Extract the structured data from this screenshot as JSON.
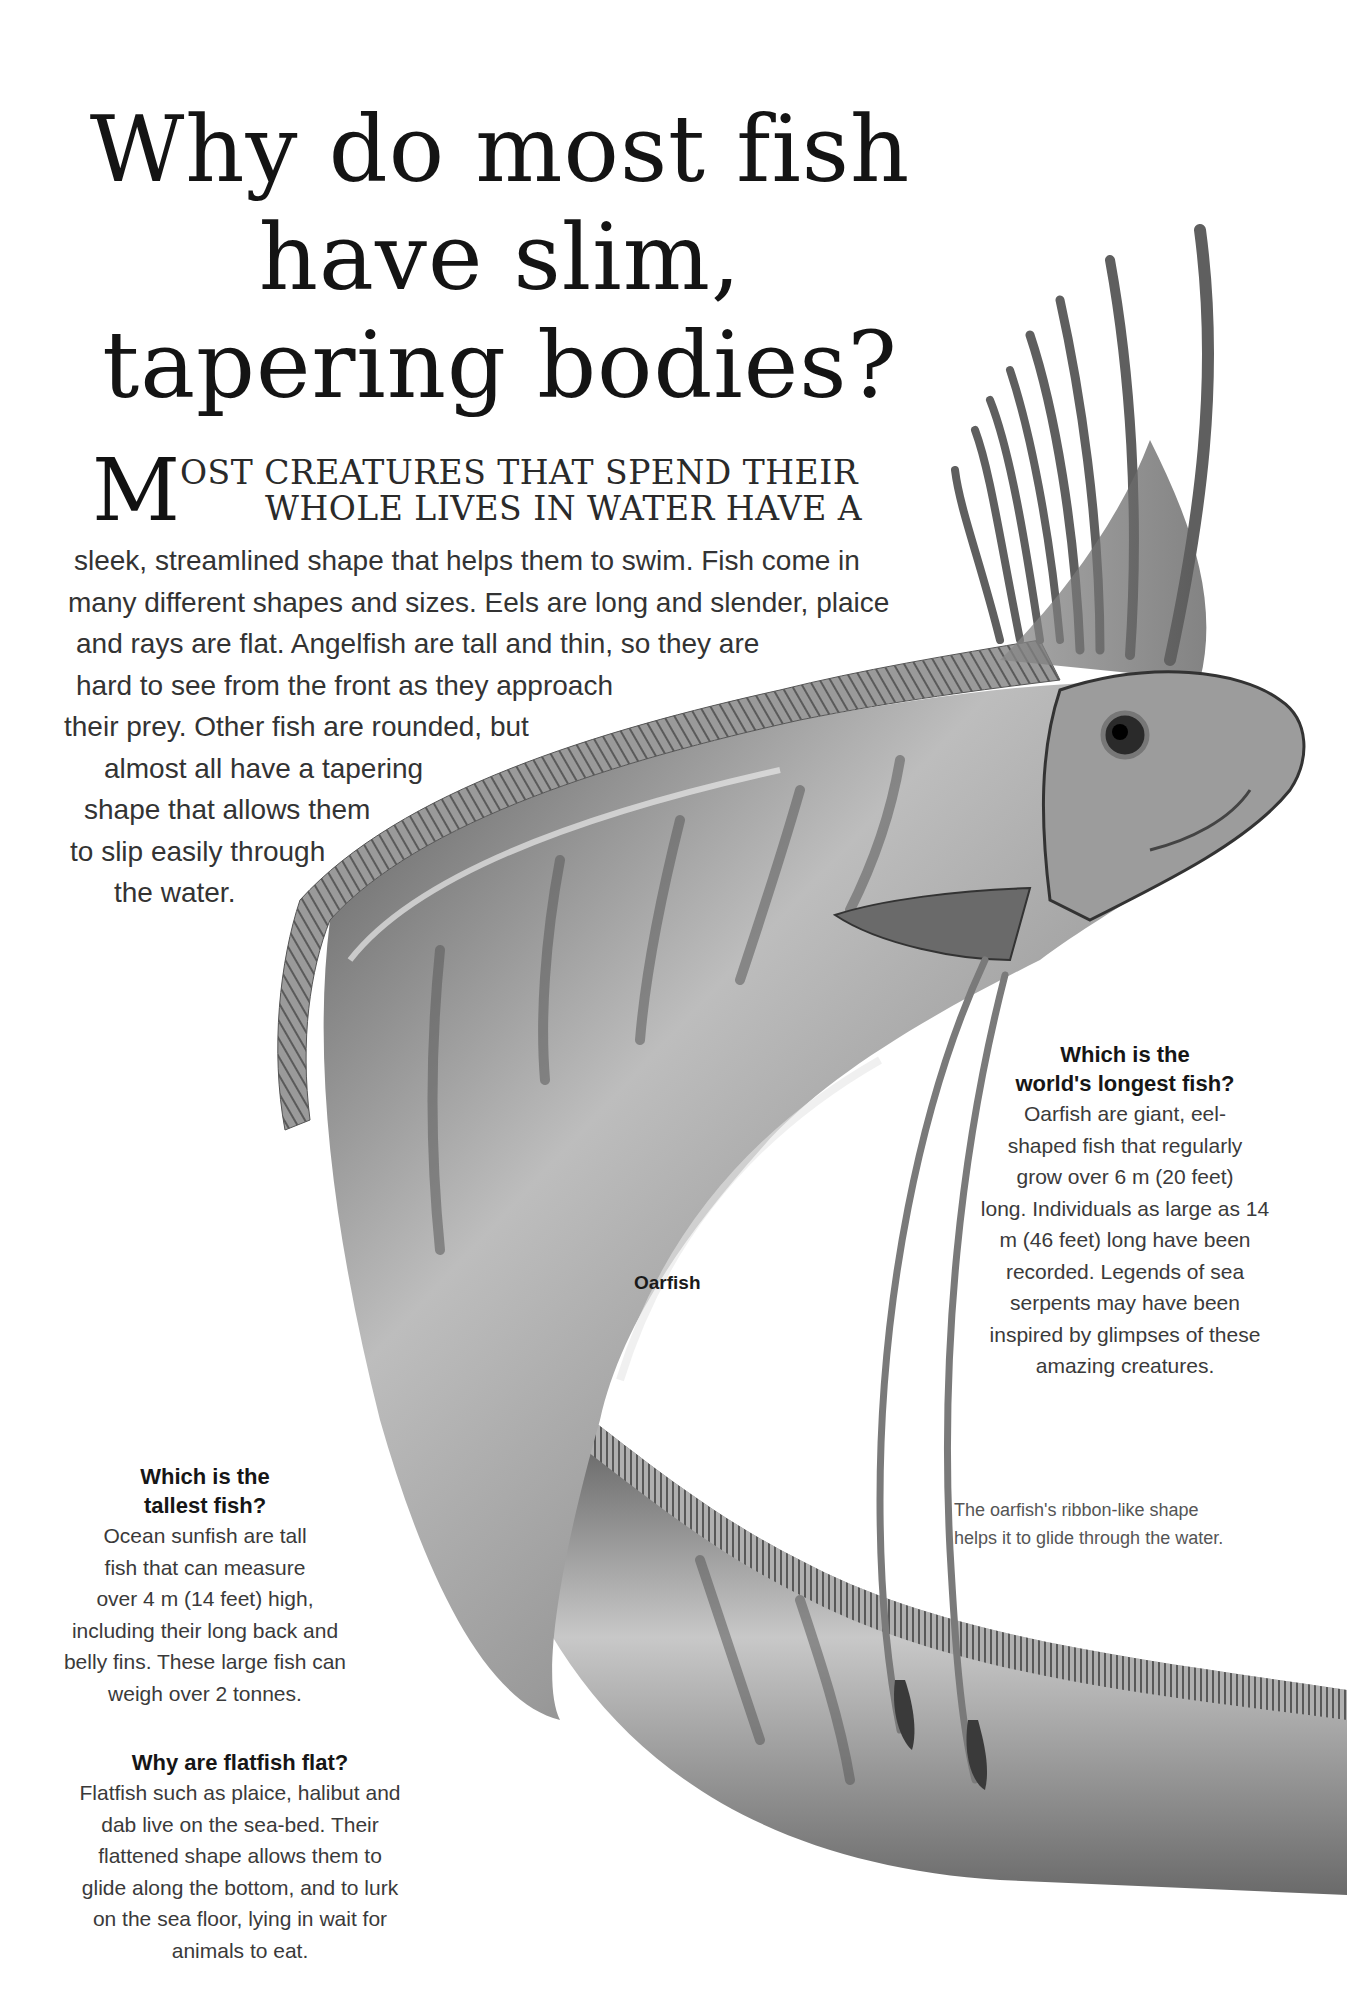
{
  "title": {
    "lines": [
      "Why do most fish",
      "have slim,",
      "tapering bodies?"
    ]
  },
  "intro": {
    "dropcap": "M",
    "caps_lines": [
      "OST CREATURES THAT SPEND THEIR",
      "WHOLE LIVES IN WATER HAVE A"
    ],
    "body_lines": [
      "sleek, streamlined shape that helps them to swim. Fish come in",
      "many different shapes and sizes. Eels are long and slender, plaice",
      "and rays are flat. Angelfish are tall and thin, so they are",
      "hard to see from the front as they approach",
      "their prey. Other fish are rounded, but",
      "almost all have a tapering",
      "shape that allows them",
      "to slip easily through",
      "the water."
    ]
  },
  "illustration": {
    "label": "Oarfish",
    "caption_lines": [
      "The oarfish's ribbon-like shape",
      "helps it to glide through the water."
    ],
    "colors": {
      "body_dark": "#3c3c3c",
      "body_mid": "#8a8a8a",
      "body_light": "#d8d8d8",
      "fin": "#6e6e6e"
    }
  },
  "sidebars": {
    "longest": {
      "heading_lines": [
        "Which is the",
        "world's longest fish?"
      ],
      "body_lines": [
        "Oarfish are giant, eel-",
        "shaped fish that regularly",
        "grow over 6 m (20 feet)",
        "long. Individuals as large as 14",
        "m (46 feet) long have been",
        "recorded. Legends of sea",
        "serpents may have been",
        "inspired by glimpses of these",
        "amazing creatures."
      ]
    },
    "tallest": {
      "heading_lines": [
        "Which is the",
        "tallest fish?"
      ],
      "body_lines": [
        "Ocean sunfish are tall",
        "fish that can measure",
        "over 4 m (14 feet) high,",
        "including their long back and",
        "belly fins. These large fish can",
        "weigh over 2 tonnes."
      ]
    },
    "flatfish": {
      "heading_lines": [
        "Why are flatfish flat?"
      ],
      "body_lines": [
        "Flatfish such as plaice, halibut and",
        "dab live on the sea-bed. Their",
        "flattened shape allows them to",
        "glide along the bottom, and to lurk",
        "on the sea floor, lying in wait for",
        "animals to eat."
      ]
    }
  }
}
